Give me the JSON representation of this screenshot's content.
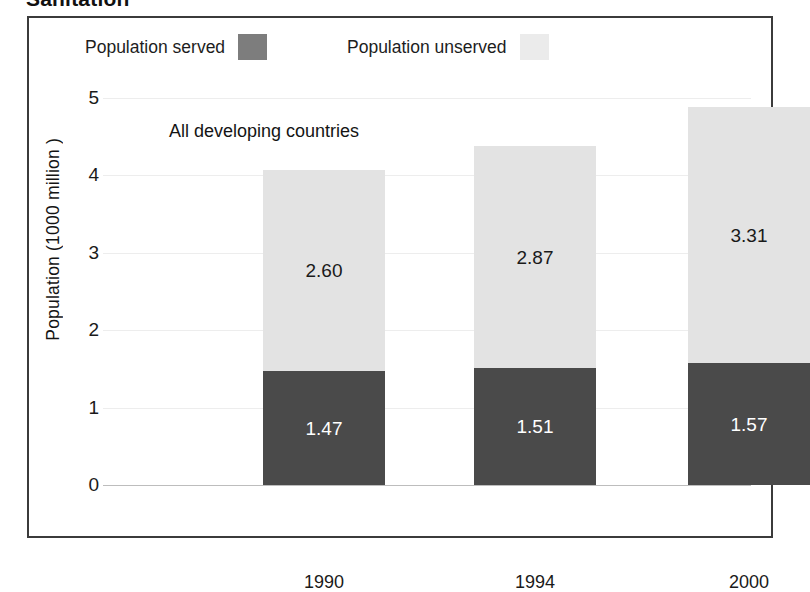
{
  "page": {
    "title": "Sanitation"
  },
  "chart_data": {
    "type": "bar",
    "subtype": "stacked-bar",
    "title": "Sanitation",
    "annotation": "All developing countries",
    "xlabel": "",
    "ylabel": "Population (1000 million )",
    "ylim": [
      0,
      5
    ],
    "yticks": [
      "0",
      "1",
      "2",
      "3",
      "4",
      "5"
    ],
    "grid": true,
    "legend_position": "top",
    "categories": [
      "1990",
      "1994",
      "2000"
    ],
    "series": [
      {
        "name": "Population served",
        "color": "#4a4a4a",
        "legend_swatch_color": "#7d7d7d",
        "label_color": "#ffffff",
        "values": [
          1.47,
          1.51,
          1.57
        ],
        "labels": [
          "1.47",
          "1.51",
          "1.57"
        ]
      },
      {
        "name": "Population unserved",
        "color": "#e3e3e3",
        "legend_swatch_color": "#ebebeb",
        "label_color": "#1a1a1a",
        "values": [
          2.6,
          2.87,
          3.31
        ],
        "labels": [
          "2.60",
          "2.87",
          "3.31"
        ]
      }
    ],
    "totals": [
      4.07,
      4.38,
      4.88
    ]
  },
  "colors": {
    "served": "#4a4a4a",
    "unserved": "#e3e3e3",
    "frame": "#3b3b3b",
    "grid": "#ededed",
    "background": "#ffffff"
  }
}
